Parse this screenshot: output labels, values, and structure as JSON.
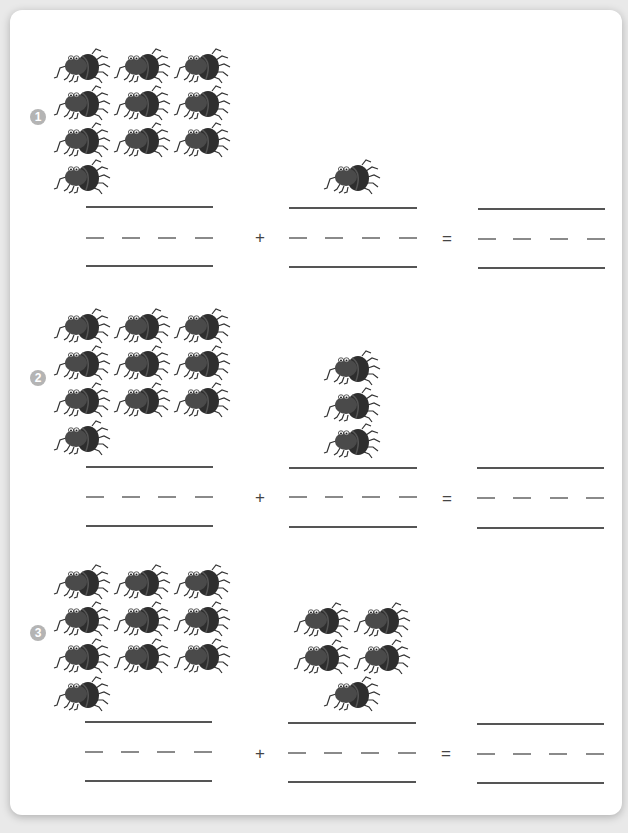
{
  "worksheet": {
    "colors": {
      "background": "#e9e9e9",
      "card": "#ffffff",
      "badge": "#b4b4b4",
      "line": "#555555",
      "spider_body": "#3a3a3a"
    },
    "operators": {
      "plus": "+",
      "equals": "="
    },
    "problems": [
      {
        "number": "1",
        "first_group_count": 10,
        "second_group_count": 1,
        "first_group_layout": "3x3 grid + 1",
        "second_group_layout": "1"
      },
      {
        "number": "2",
        "first_group_count": 10,
        "second_group_count": 3,
        "first_group_layout": "3x3 grid + 1",
        "second_group_layout": "vertical column of 3"
      },
      {
        "number": "3",
        "first_group_count": 10,
        "second_group_count": 5,
        "first_group_layout": "3x3 grid + 1",
        "second_group_layout": "2x2 grid + 1"
      }
    ],
    "answer_fields": [
      {
        "problem": "1",
        "first_addend": "",
        "second_addend": "",
        "sum": ""
      },
      {
        "problem": "2",
        "first_addend": "",
        "second_addend": "",
        "sum": ""
      },
      {
        "problem": "3",
        "first_addend": "",
        "second_addend": "",
        "sum": ""
      }
    ]
  }
}
